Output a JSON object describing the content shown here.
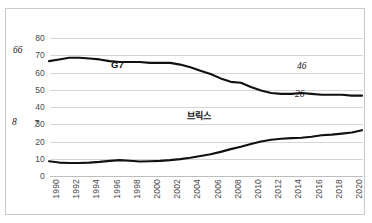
{
  "chart_data": {
    "type": "line",
    "title": "",
    "subtitle": "",
    "xlabel": "",
    "ylabel": "",
    "ylim": [
      0,
      80
    ],
    "yticks": [
      0,
      10,
      20,
      30,
      40,
      50,
      60,
      70,
      80
    ],
    "grid": true,
    "legend_position": "inline-annotation",
    "x": [
      "1990",
      "1991",
      "1992",
      "1993",
      "1994",
      "1995",
      "1996",
      "1997",
      "1998",
      "1999",
      "2000",
      "2001",
      "2002",
      "2003",
      "2004",
      "2005",
      "2006",
      "2007",
      "2008",
      "2009",
      "2010",
      "2011",
      "2012",
      "2013",
      "2014",
      "2015",
      "2016",
      "2017",
      "2018",
      "2019",
      "2020",
      "2021"
    ],
    "xtick_labels": [
      "1990",
      "1992",
      "1994",
      "1996",
      "1998",
      "2000",
      "2002",
      "2004",
      "2006",
      "2008",
      "2010",
      "2012",
      "2014",
      "2016",
      "2018",
      "2020"
    ],
    "series": [
      {
        "name": "G7",
        "color": "#111111",
        "values": [
          66,
          67,
          68,
          68,
          67.5,
          67,
          66,
          65.5,
          65.5,
          65.5,
          65,
          65,
          65,
          64,
          62.5,
          60.5,
          58.5,
          56,
          54,
          53.5,
          51,
          49,
          47.5,
          47,
          47,
          47.5,
          47,
          46.5,
          46.5,
          46.5,
          46,
          46
        ]
      },
      {
        "name": "브릭스",
        "color": "#111111",
        "values": [
          8,
          7.2,
          7,
          7,
          7.2,
          7.6,
          8.2,
          8.6,
          8.3,
          7.8,
          8,
          8.2,
          8.6,
          9.2,
          10,
          11,
          12,
          13.4,
          15,
          16.4,
          18,
          19.4,
          20.4,
          21,
          21.4,
          21.6,
          22.2,
          23,
          23.4,
          24,
          24.6,
          26
        ]
      }
    ],
    "point_labels": [
      {
        "series": "G7",
        "text": "66",
        "x": "1990",
        "value": 66
      },
      {
        "series": "G7",
        "text": "46",
        "x": "2021",
        "value": 46
      },
      {
        "series": "브릭스",
        "text": "8",
        "x": "1990",
        "value": 8
      },
      {
        "series": "브릭스",
        "text": "7",
        "x": "1992",
        "value": 7
      },
      {
        "series": "브릭스",
        "text": "26",
        "x": "2021",
        "value": 26
      }
    ],
    "annotations": [
      {
        "text": "G7",
        "series": "G7"
      },
      {
        "text": "브릭스",
        "series": "브릭스"
      }
    ]
  }
}
